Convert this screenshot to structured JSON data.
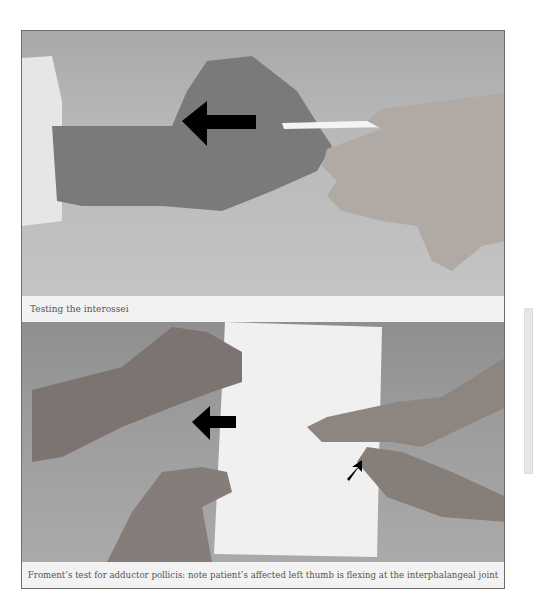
{
  "figures": [
    {
      "caption": "Testing the interossei",
      "photo_description": "Examiner pulls a card held between patient's fingers; arrow indicates pull direction",
      "arrow": {
        "direction": "left",
        "color": "#000000"
      }
    },
    {
      "caption": "Froment’s test for adductor pollicis: note patient’s affected left thumb is flexing at the interphalangeal joint",
      "photo_description": "Two pairs of hands gripping a sheet of paper; large arrow points left, small arrow points at flexed thumb",
      "arrows": [
        {
          "direction": "left",
          "color": "#000000"
        },
        {
          "direction": "up-right",
          "color": "#000000"
        }
      ]
    }
  ],
  "colors": {
    "frame_border": "#6d6d6d",
    "caption_bg": "#f2f2f2",
    "caption_text": "#555555",
    "sidebar_bar": "#e6e6e6"
  }
}
